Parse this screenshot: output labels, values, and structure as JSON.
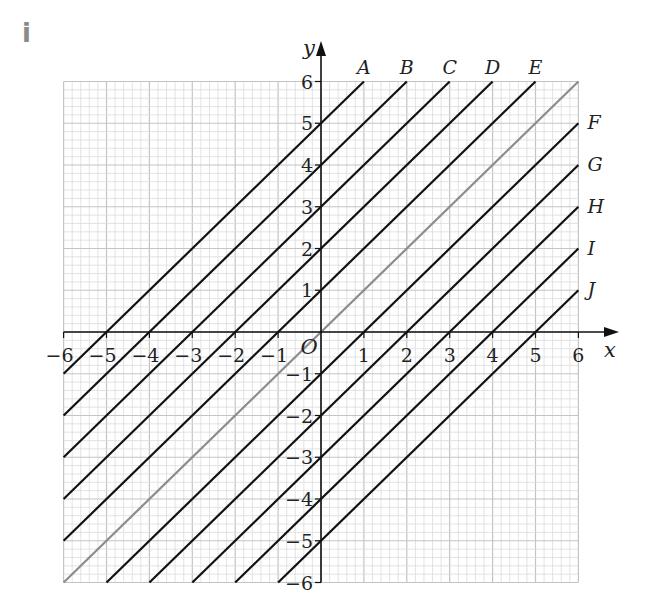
{
  "part_label": "i",
  "axes": {
    "x_label": "x",
    "y_label": "y",
    "origin_label": "O",
    "x_ticks": [
      "−6",
      "−5",
      "−4",
      "−3",
      "−2",
      "−1",
      "1",
      "2",
      "3",
      "4",
      "5",
      "6"
    ],
    "y_ticks": [
      "6",
      "5",
      "4",
      "3",
      "2",
      "1",
      "−1",
      "−2",
      "−3",
      "−4",
      "−5",
      "−6"
    ],
    "xlim": [
      -6,
      6
    ],
    "ylim": [
      -6,
      6
    ],
    "minor_divisions_per_unit": 5
  },
  "colors": {
    "line": "#111111",
    "highlight_line": "#8c8c8c",
    "grid_minor": "#dcdcdc",
    "grid_major": "#c4c4c4",
    "part_label": "#8a8a8a"
  },
  "lines": [
    {
      "label": "A",
      "equation": "y = x + 5",
      "from": [
        -6,
        -1
      ],
      "to": [
        1,
        6
      ]
    },
    {
      "label": "B",
      "equation": "y = x + 4",
      "from": [
        -6,
        -2
      ],
      "to": [
        2,
        6
      ]
    },
    {
      "label": "C",
      "equation": "y = x + 3",
      "from": [
        -6,
        -3
      ],
      "to": [
        3,
        6
      ]
    },
    {
      "label": "D",
      "equation": "y = x + 2",
      "from": [
        -6,
        -4
      ],
      "to": [
        4,
        6
      ]
    },
    {
      "label": "E",
      "equation": "y = x + 1",
      "from": [
        -6,
        -5
      ],
      "to": [
        5,
        6
      ]
    },
    {
      "label": "",
      "equation": "y = x",
      "from": [
        -6,
        -6
      ],
      "to": [
        6,
        6
      ],
      "highlight": true
    },
    {
      "label": "F",
      "equation": "y = x − 1",
      "from": [
        -5,
        -6
      ],
      "to": [
        6,
        5
      ]
    },
    {
      "label": "G",
      "equation": "y = x − 2",
      "from": [
        -4,
        -6
      ],
      "to": [
        6,
        4
      ]
    },
    {
      "label": "H",
      "equation": "y = x − 3",
      "from": [
        -3,
        -6
      ],
      "to": [
        6,
        3
      ]
    },
    {
      "label": "I",
      "equation": "y = x − 4",
      "from": [
        -2,
        -6
      ],
      "to": [
        6,
        2
      ]
    },
    {
      "label": "J",
      "equation": "y = x − 5",
      "from": [
        -1,
        -6
      ],
      "to": [
        6,
        1
      ]
    }
  ],
  "chart_data": {
    "type": "line",
    "title": "",
    "xlabel": "x",
    "ylabel": "y",
    "xlim": [
      -6,
      6
    ],
    "ylim": [
      -6,
      6
    ],
    "grid": true,
    "series": [
      {
        "name": "A",
        "x": [
          -6,
          1
        ],
        "y": [
          -1,
          6
        ]
      },
      {
        "name": "B",
        "x": [
          -6,
          2
        ],
        "y": [
          -2,
          6
        ]
      },
      {
        "name": "C",
        "x": [
          -6,
          3
        ],
        "y": [
          -3,
          6
        ]
      },
      {
        "name": "D",
        "x": [
          -6,
          4
        ],
        "y": [
          -4,
          6
        ]
      },
      {
        "name": "E",
        "x": [
          -6,
          5
        ],
        "y": [
          -5,
          6
        ]
      },
      {
        "name": "y = x (grey)",
        "x": [
          -6,
          6
        ],
        "y": [
          -6,
          6
        ]
      },
      {
        "name": "F",
        "x": [
          -5,
          6
        ],
        "y": [
          -6,
          5
        ]
      },
      {
        "name": "G",
        "x": [
          -4,
          6
        ],
        "y": [
          -6,
          4
        ]
      },
      {
        "name": "H",
        "x": [
          -3,
          6
        ],
        "y": [
          -6,
          3
        ]
      },
      {
        "name": "I",
        "x": [
          -2,
          6
        ],
        "y": [
          -6,
          2
        ]
      },
      {
        "name": "J",
        "x": [
          -1,
          6
        ],
        "y": [
          -6,
          1
        ]
      }
    ]
  }
}
